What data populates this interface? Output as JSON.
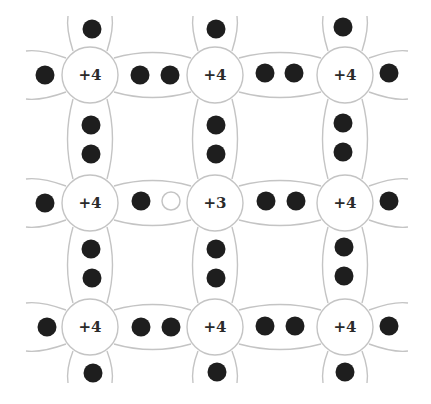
{
  "diagram": {
    "colors": {
      "background": "#ffffff",
      "bond_outline": "#c4c4c4",
      "atom_fill": "#ffffff",
      "atom_outline": "#c4c4c4",
      "electron": "#1e1e1e",
      "hole_outline": "#c4c4c4",
      "label": "#2a2a2a"
    },
    "columns_x": [
      90,
      215,
      345
    ],
    "rows_y": [
      75,
      203,
      327
    ],
    "atom_radius": 28,
    "atoms": [
      {
        "row": 0,
        "col": 0,
        "label": "+4"
      },
      {
        "row": 0,
        "col": 1,
        "label": "+4"
      },
      {
        "row": 0,
        "col": 2,
        "label": "+4"
      },
      {
        "row": 1,
        "col": 0,
        "label": "+4"
      },
      {
        "row": 1,
        "col": 1,
        "label": "+3"
      },
      {
        "row": 1,
        "col": 2,
        "label": "+4"
      },
      {
        "row": 2,
        "col": 0,
        "label": "+4"
      },
      {
        "row": 2,
        "col": 1,
        "label": "+4"
      },
      {
        "row": 2,
        "col": 2,
        "label": "+4"
      }
    ],
    "electrons": [
      {
        "x": 92,
        "y": 29
      },
      {
        "x": 216,
        "y": 29
      },
      {
        "x": 343,
        "y": 27
      },
      {
        "x": 45,
        "y": 75
      },
      {
        "x": 140,
        "y": 75
      },
      {
        "x": 170,
        "y": 75
      },
      {
        "x": 265,
        "y": 73
      },
      {
        "x": 294,
        "y": 73
      },
      {
        "x": 389,
        "y": 73
      },
      {
        "x": 91,
        "y": 125
      },
      {
        "x": 91,
        "y": 154
      },
      {
        "x": 216,
        "y": 125
      },
      {
        "x": 216,
        "y": 154
      },
      {
        "x": 343,
        "y": 123
      },
      {
        "x": 343,
        "y": 152
      },
      {
        "x": 45,
        "y": 203
      },
      {
        "x": 141,
        "y": 201
      },
      {
        "x": 266,
        "y": 201
      },
      {
        "x": 296,
        "y": 201
      },
      {
        "x": 389,
        "y": 201
      },
      {
        "x": 91,
        "y": 249
      },
      {
        "x": 92,
        "y": 278
      },
      {
        "x": 216,
        "y": 249
      },
      {
        "x": 216,
        "y": 278
      },
      {
        "x": 344,
        "y": 247
      },
      {
        "x": 344,
        "y": 276
      },
      {
        "x": 47,
        "y": 327
      },
      {
        "x": 141,
        "y": 327
      },
      {
        "x": 171,
        "y": 327
      },
      {
        "x": 265,
        "y": 326
      },
      {
        "x": 295,
        "y": 326
      },
      {
        "x": 389,
        "y": 326
      },
      {
        "x": 93,
        "y": 373
      },
      {
        "x": 217,
        "y": 372
      },
      {
        "x": 345,
        "y": 372
      }
    ],
    "holes": [
      {
        "x": 171,
        "y": 201
      }
    ],
    "electron_radius": 9.5
  }
}
